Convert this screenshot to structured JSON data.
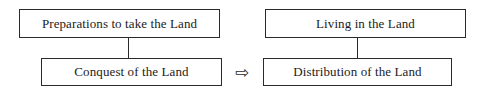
{
  "diagram": {
    "background_color": "#ffffff",
    "line_color": "#2b2b2b",
    "text_color": "#1c1c1c",
    "boxes": [
      {
        "id": "prep",
        "label": "Preparations to take the Land"
      },
      {
        "id": "conquest",
        "label": "Conquest of the Land"
      },
      {
        "id": "living",
        "label": "Living in the Land"
      },
      {
        "id": "dist",
        "label": "Distribution of the Land"
      }
    ],
    "connectors": [
      {
        "id": "left",
        "from": "prep",
        "to": "conquest",
        "style": "vertical-line"
      },
      {
        "id": "right",
        "from": "living",
        "to": "dist",
        "style": "vertical-line"
      }
    ],
    "arrow": {
      "glyph": "⇨",
      "icon": "hollow-right-arrow-icon",
      "from": "conquest",
      "to": "dist"
    }
  }
}
